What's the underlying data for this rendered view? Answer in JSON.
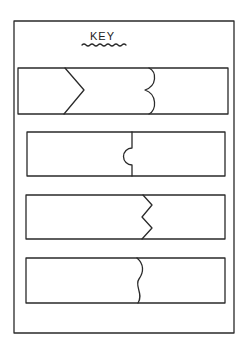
{
  "key": {
    "title": "KEY",
    "title_underline": "wavy",
    "items": [
      {
        "joint": "chevron-and-curly-bracket",
        "description": "Box with a chevron (>) line and a double-curved (curly brace) line"
      },
      {
        "joint": "semicircle-tab",
        "description": "Box divided by a straight line with a semicircular tab"
      },
      {
        "joint": "zigzag",
        "description": "Box divided by a zigzag line"
      },
      {
        "joint": "wavy",
        "description": "Box divided by a wavy line"
      }
    ]
  },
  "colors": {
    "line": "#2a2a2a",
    "background": "#ffffff"
  }
}
